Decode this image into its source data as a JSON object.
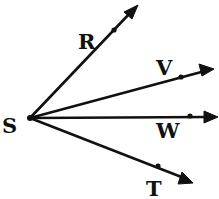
{
  "diagram": {
    "vertex": {
      "label": "S"
    },
    "rays": [
      {
        "id": "SR",
        "label": "R"
      },
      {
        "id": "SV",
        "label": "V"
      },
      {
        "id": "SW",
        "label": "W"
      },
      {
        "id": "ST",
        "label": "T"
      }
    ],
    "colors": {
      "stroke": "#111111",
      "background": "#ffffff"
    }
  }
}
